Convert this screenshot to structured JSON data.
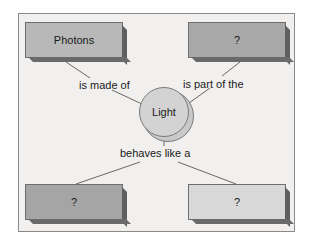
{
  "diagram": {
    "center": {
      "label": "Light"
    },
    "nodes": [
      {
        "id": "top-left",
        "label": "Photons",
        "color": "#b8b8b8"
      },
      {
        "id": "top-right",
        "label": "?",
        "color": "#a8a8a8"
      },
      {
        "id": "bottom-left",
        "label": "?",
        "color": "#a5a5a5"
      },
      {
        "id": "bottom-right",
        "label": "?",
        "color": "#d8d8d8"
      }
    ],
    "links": [
      {
        "label": "is made of"
      },
      {
        "label": "is part of the"
      },
      {
        "label": "behaves like a"
      }
    ],
    "colors": {
      "background": "#f1f0ee",
      "border": "#8a8a8a",
      "circle": "#d3d3d3"
    }
  }
}
